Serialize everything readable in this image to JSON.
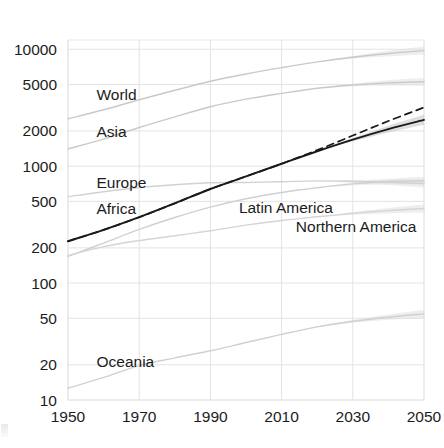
{
  "chart_data": {
    "type": "line",
    "title": "",
    "subtitle": "",
    "xlabel": "",
    "ylabel": "",
    "yscale": "log",
    "xscale": "linear",
    "xlim": [
      1950,
      2050
    ],
    "ylim": [
      10,
      12000
    ],
    "grid": true,
    "legend_position": "inline-labels",
    "x_ticks": [
      "1950",
      "1970",
      "1990",
      "2010",
      "2030",
      "2050"
    ],
    "x_tick_values": [
      1950,
      1970,
      1990,
      2010,
      2030,
      2050
    ],
    "y_ticks": [
      "10",
      "20",
      "50",
      "100",
      "200",
      "500",
      "1000",
      "2000",
      "5000",
      "10000"
    ],
    "y_tick_values": [
      10,
      20,
      50,
      100,
      200,
      500,
      1000,
      2000,
      5000,
      10000
    ],
    "x": [
      1950,
      1960,
      1970,
      1980,
      1990,
      2000,
      2010,
      2020,
      2030,
      2040,
      2050
    ],
    "series": [
      {
        "name": "World",
        "color": "#c9c9c9",
        "style": "solid",
        "width": 1.4,
        "label_x": 1958,
        "label_y": 4100,
        "values": [
          2536,
          3035,
          3700,
          4458,
          5327,
          6143,
          6957,
          7795,
          8548,
          9199,
          9735
        ]
      },
      {
        "name": "Asia",
        "color": "#c9c9c9",
        "style": "solid",
        "width": 1.4,
        "label_x": 1958,
        "label_y": 1950,
        "values": [
          1405,
          1705,
          2142,
          2642,
          3226,
          3741,
          4194,
          4641,
          4947,
          5154,
          5267
        ]
      },
      {
        "name": "Europe",
        "color": "#d2d2d2",
        "style": "solid",
        "width": 1.4,
        "label_x": 1958,
        "label_y": 720,
        "values": [
          549,
          605,
          657,
          694,
          721,
          726,
          736,
          748,
          741,
          728,
          710
        ]
      },
      {
        "name": "Africa",
        "color": "#1a1a1a",
        "style": "solid",
        "width": 1.9,
        "label_x": 1958,
        "label_y": 430,
        "values": [
          228,
          285,
          366,
          481,
          638,
          818,
          1049,
          1341,
          1688,
          2077,
          2489
        ]
      },
      {
        "name": "Africa (high variant)",
        "color": "#1a1a1a",
        "style": "dashed",
        "width": 1.7,
        "label_x": null,
        "label_y": null,
        "values": [
          228,
          285,
          366,
          481,
          638,
          818,
          1049,
          1372,
          1827,
          2432,
          3180
        ]
      },
      {
        "name": "Latin America",
        "color": "#d0d0d0",
        "style": "solid",
        "width": 1.4,
        "label_x": 1998,
        "label_y": 440,
        "values": [
          169,
          220,
          288,
          364,
          446,
          526,
          596,
          654,
          706,
          740,
          751
        ]
      },
      {
        "name": "Northern America",
        "color": "#d4d4d4",
        "style": "solid",
        "width": 1.4,
        "label_x": 2014,
        "label_y": 300,
        "values": [
          172,
          205,
          231,
          254,
          280,
          313,
          343,
          369,
          395,
          417,
          435
        ]
      },
      {
        "name": "Oceania",
        "color": "#d0d0d0",
        "style": "solid",
        "width": 1.4,
        "label_x": 1958,
        "label_y": 21,
        "values": [
          12.6,
          15.6,
          19.7,
          22.9,
          26.4,
          31.0,
          36.4,
          42.2,
          47.1,
          51.1,
          54.5
        ]
      }
    ],
    "projection_start_year": 2012,
    "annotations": [
      {
        "text": "World",
        "x": 1958,
        "y": 4100
      },
      {
        "text": "Asia",
        "x": 1958,
        "y": 1950
      },
      {
        "text": "Europe",
        "x": 1958,
        "y": 720
      },
      {
        "text": "Africa",
        "x": 1958,
        "y": 430
      },
      {
        "text": "Latin America",
        "x": 1998,
        "y": 440
      },
      {
        "text": "Northern America",
        "x": 2014,
        "y": 300
      },
      {
        "text": "Oceania",
        "x": 1958,
        "y": 21
      }
    ]
  }
}
